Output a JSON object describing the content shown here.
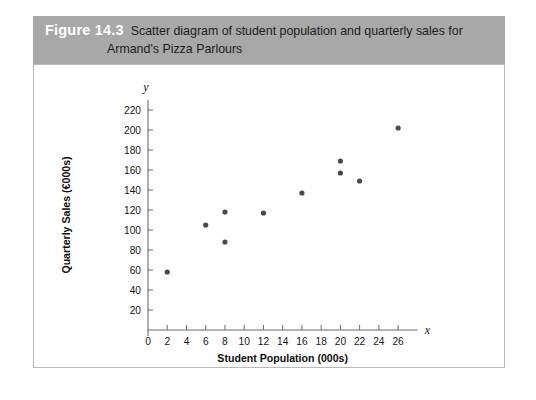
{
  "figure": {
    "number_label": "Figure 14.3",
    "caption_line1": "Scatter diagram of student population and quarterly sales for",
    "caption_line2": "Armand's Pizza Parlours",
    "band_color": "#a8a8a8",
    "panel_border_color": "#b9b9b9"
  },
  "chart_data": {
    "type": "scatter",
    "title": "",
    "xlabel": "Student Population (000s)",
    "ylabel": "Quarterly Sales (€000s)",
    "x_axis_variable": "x",
    "y_axis_variable": "y",
    "xlim": [
      0,
      28
    ],
    "ylim": [
      0,
      230
    ],
    "xticks": [
      0,
      2,
      4,
      6,
      8,
      10,
      12,
      14,
      16,
      18,
      20,
      22,
      24,
      26
    ],
    "yticks": [
      20,
      40,
      60,
      80,
      100,
      120,
      140,
      160,
      180,
      200,
      220
    ],
    "xticklabels": [
      "0",
      "2",
      "4",
      "6",
      "8",
      "10",
      "12",
      "14",
      "16",
      "18",
      "20",
      "22",
      "24",
      "26"
    ],
    "yticklabels": [
      "20",
      "40",
      "60",
      "80",
      "100",
      "120",
      "140",
      "160",
      "180",
      "200",
      "220"
    ],
    "grid": false,
    "legend": false,
    "marker_color": "#4a4a4a",
    "x": [
      2,
      6,
      8,
      8,
      12,
      16,
      20,
      20,
      22,
      26
    ],
    "y": [
      58,
      105,
      88,
      118,
      117,
      137,
      157,
      169,
      149,
      202
    ],
    "points": [
      {
        "x": 2,
        "y": 58
      },
      {
        "x": 6,
        "y": 105
      },
      {
        "x": 8,
        "y": 88
      },
      {
        "x": 8,
        "y": 118
      },
      {
        "x": 12,
        "y": 117
      },
      {
        "x": 16,
        "y": 137
      },
      {
        "x": 20,
        "y": 157
      },
      {
        "x": 20,
        "y": 169
      },
      {
        "x": 22,
        "y": 149
      },
      {
        "x": 26,
        "y": 202
      }
    ]
  }
}
